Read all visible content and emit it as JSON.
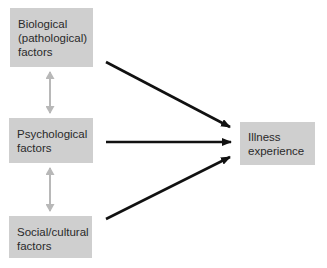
{
  "diagram": {
    "nodes": [
      {
        "id": "biological",
        "label": "Biological\n(pathological)\nfactors"
      },
      {
        "id": "psychological",
        "label": "Psychological\nfactors"
      },
      {
        "id": "social",
        "label": "Social/cultural\nfactors"
      },
      {
        "id": "illness",
        "label": "Illness\nexperience"
      }
    ],
    "edges": [
      {
        "from": "biological",
        "to": "illness",
        "type": "directed"
      },
      {
        "from": "psychological",
        "to": "illness",
        "type": "directed"
      },
      {
        "from": "social",
        "to": "illness",
        "type": "directed"
      },
      {
        "from": "biological",
        "to": "psychological",
        "type": "bidirectional"
      },
      {
        "from": "psychological",
        "to": "social",
        "type": "bidirectional"
      }
    ],
    "colors": {
      "box": "#cfcfcf",
      "arrow": "#111111",
      "bidirectional_arrow": "#b8b8b8",
      "text": "#2a2a2a"
    }
  }
}
